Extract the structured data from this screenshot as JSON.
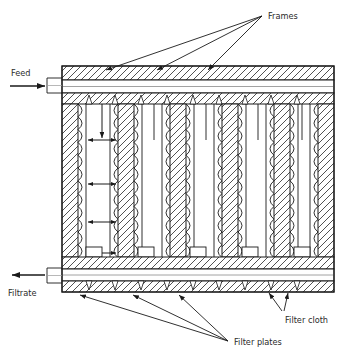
{
  "figure": {
    "type": "engineering-cross-section-diagram",
    "background_color": "#ffffff",
    "line_color": "#1a1a1a",
    "hatch_color": "#333333"
  },
  "labels": {
    "frames": "Frames",
    "feed": "Feed",
    "filtrate": "Filtrate",
    "filter_cloth": "Filter cloth",
    "filter_plates": "Filter plates"
  },
  "geometry": {
    "body_left": 62,
    "body_right": 334,
    "body_top": 66,
    "body_bottom": 292,
    "top_header_y": 66,
    "top_header_h": 36,
    "bottom_header_y": 257,
    "bottom_header_h": 35,
    "plate_count": 6,
    "chamber_count": 5,
    "plate_x": [
      62,
      118,
      170,
      222,
      274,
      318
    ],
    "plate_width": 16
  },
  "annotations": {
    "frames_arrow_targets": [
      {
        "x": 104,
        "y": 73
      },
      {
        "x": 155,
        "y": 73
      },
      {
        "x": 206,
        "y": 73
      }
    ],
    "frames_arrow_origin": {
      "x": 262,
      "y": 16
    },
    "filter_plates_arrow_origin": {
      "x": 228,
      "y": 342
    },
    "filter_plates_arrow_targets": [
      {
        "x": 82,
        "y": 295
      },
      {
        "x": 134,
        "y": 295
      },
      {
        "x": 180,
        "y": 295
      }
    ],
    "filter_cloth_arrow_origin": {
      "x": 282,
      "y": 312
    },
    "filter_cloth_arrow_targets": [
      {
        "x": 269,
        "y": 294
      },
      {
        "x": 288,
        "y": 294
      }
    ],
    "chamber_dimension_arrows": 3,
    "chamber_drop_lines": 5
  }
}
